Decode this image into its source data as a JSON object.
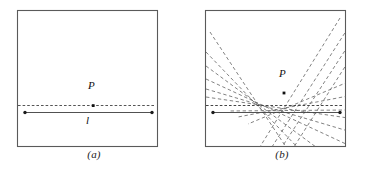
{
  "figure": {
    "width": 376,
    "height": 169,
    "background": "#ffffff",
    "stroke_solid": "#4a4a4a",
    "stroke_dashed": "#6b6b6b",
    "stroke_dotted": "#555555",
    "label_color": "#111111"
  },
  "panels": [
    {
      "id": "a",
      "caption": "(a)",
      "box": {
        "x": 17,
        "y": 10,
        "w": 140,
        "h": 136
      },
      "point": {
        "label": "P",
        "x": 93,
        "y": 106,
        "label_x": 88,
        "label_y": 86
      },
      "dotted_line": {
        "y": 105,
        "x1": 18,
        "x2": 156
      },
      "segment": {
        "label": "l",
        "y": 112,
        "x1": 25,
        "x2": 152,
        "label_x": 86,
        "label_y": 120
      }
    },
    {
      "id": "b",
      "caption": "(b)",
      "box": {
        "x": 17,
        "y": 10,
        "w": 140,
        "h": 136
      },
      "point": {
        "label": "P",
        "x": 96,
        "y": 93,
        "label_x": 91,
        "label_y": 74
      },
      "dotted_line": {
        "y": 105,
        "x1": 18,
        "x2": 156
      },
      "segment": {
        "label": "",
        "y": 112,
        "x1": 25,
        "x2": 152
      },
      "focus_left": {
        "x": 67,
        "y": 105
      },
      "focus_right": {
        "x": 127,
        "y": 80
      },
      "dashed_lines": [
        {
          "x1": 22,
          "y1": 32,
          "x2": 96,
          "y2": 146
        },
        {
          "x1": 22,
          "y1": 53,
          "x2": 108,
          "y2": 146
        },
        {
          "x1": 22,
          "y1": 66,
          "x2": 126,
          "y2": 146
        },
        {
          "x1": 22,
          "y1": 78,
          "x2": 150,
          "y2": 146
        },
        {
          "x1": 22,
          "y1": 88,
          "x2": 157,
          "y2": 133
        },
        {
          "x1": 22,
          "y1": 96,
          "x2": 157,
          "y2": 120
        },
        {
          "x1": 157,
          "y1": 28,
          "x2": 86,
          "y2": 146
        },
        {
          "x1": 152,
          "y1": 22,
          "x2": 74,
          "y2": 146
        },
        {
          "x1": 157,
          "y1": 48,
          "x2": 98,
          "y2": 146
        },
        {
          "x1": 157,
          "y1": 62,
          "x2": 110,
          "y2": 146
        },
        {
          "x1": 157,
          "y1": 82,
          "x2": 64,
          "y2": 122
        },
        {
          "x1": 157,
          "y1": 96,
          "x2": 56,
          "y2": 116
        },
        {
          "x1": 157,
          "y1": 110,
          "x2": 48,
          "y2": 112
        }
      ]
    }
  ],
  "labels": {
    "point_p": "P",
    "line_l": "l",
    "caption_a": "(a)",
    "caption_b": "(b)"
  }
}
